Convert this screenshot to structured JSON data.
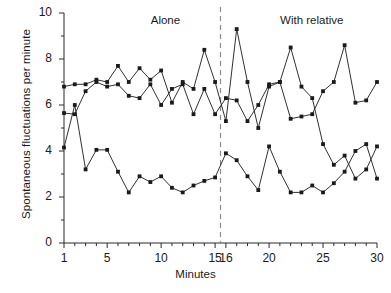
{
  "chart_data": {
    "type": "line",
    "title": "",
    "xlabel": "Minutes",
    "ylabel": "Spontaneous fluctuations per minute",
    "xlim": [
      1,
      30
    ],
    "ylim": [
      0,
      10
    ],
    "grid": false,
    "legend": "none",
    "x_ticks": [
      {
        "value": 1,
        "label": "1"
      },
      {
        "value": 5,
        "label": "5"
      },
      {
        "value": 10,
        "label": "10"
      },
      {
        "value": 15,
        "label": "15"
      },
      {
        "value": 16,
        "label": "16"
      },
      {
        "value": 20,
        "label": "20"
      },
      {
        "value": 25,
        "label": "25"
      },
      {
        "value": 30,
        "label": "30"
      }
    ],
    "x_minor_ticks": [
      2,
      3,
      4,
      6,
      7,
      8,
      9,
      11,
      12,
      13,
      14,
      17,
      18,
      19,
      21,
      22,
      23,
      24,
      26,
      27,
      28,
      29
    ],
    "y_ticks": [
      {
        "value": 0,
        "label": "0"
      },
      {
        "value": 2,
        "label": "2"
      },
      {
        "value": 4,
        "label": "4"
      },
      {
        "value": 6,
        "label": "6"
      },
      {
        "value": 8,
        "label": "8"
      },
      {
        "value": 10,
        "label": "10"
      }
    ],
    "y_minor_ticks": [
      1,
      3,
      5,
      7,
      9
    ],
    "annotations": [
      {
        "name": "alone-label",
        "text": "Alone",
        "x": 10.4,
        "y": 9.6
      },
      {
        "name": "with-relative-label",
        "text": "With relative",
        "x": 23.8,
        "y": 9.6
      }
    ],
    "reference_lines": [
      {
        "name": "phase-divider",
        "orientation": "vertical",
        "x": 15.5,
        "style": "dashed",
        "color": "#8c8c8c"
      }
    ],
    "x": [
      1,
      2,
      3,
      4,
      5,
      6,
      7,
      8,
      9,
      10,
      11,
      12,
      13,
      14,
      15,
      16,
      17,
      18,
      19,
      20,
      21,
      22,
      23,
      24,
      25,
      26,
      27,
      28,
      29,
      30
    ],
    "series": [
      {
        "name": "series-upper",
        "color": "#1a1a1a",
        "marker": "square",
        "values": [
          6.8,
          6.9,
          6.9,
          7.1,
          7.0,
          7.7,
          7.0,
          7.6,
          7.1,
          7.5,
          6.1,
          7.0,
          6.7,
          8.4,
          7.0,
          5.3,
          9.3,
          7.0,
          5.0,
          6.8,
          7.0,
          5.4,
          5.5,
          5.6,
          6.6,
          7.0,
          8.6,
          6.1,
          6.2,
          7.0
        ]
      },
      {
        "name": "series-middle",
        "color": "#1a1a1a",
        "marker": "square",
        "values": [
          5.65,
          5.6,
          6.6,
          7.0,
          6.8,
          6.9,
          6.4,
          6.3,
          6.9,
          6.0,
          6.7,
          6.9,
          5.6,
          6.7,
          5.6,
          6.3,
          6.2,
          5.3,
          6.0,
          6.9,
          7.0,
          8.5,
          6.8,
          6.3,
          4.3,
          3.4,
          3.8,
          2.8,
          3.2,
          4.2
        ]
      },
      {
        "name": "series-lower",
        "color": "#1a1a1a",
        "marker": "square",
        "values": [
          4.15,
          6.0,
          3.2,
          4.05,
          4.05,
          3.1,
          2.2,
          2.9,
          2.65,
          2.9,
          2.4,
          2.2,
          2.5,
          2.7,
          2.85,
          3.9,
          3.6,
          2.9,
          2.3,
          4.2,
          3.1,
          2.2,
          2.2,
          2.5,
          2.2,
          2.6,
          3.1,
          4.0,
          4.3,
          2.8
        ]
      }
    ]
  }
}
